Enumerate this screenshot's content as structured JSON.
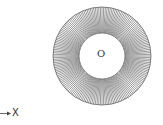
{
  "diagram": {
    "type": "annulus-with-radial-lines",
    "center_label": "O",
    "axis_label": "X",
    "geometry": {
      "center": [
        102,
        56
      ],
      "outer_radius": 49,
      "inner_radius": 23,
      "radial_line_count": 180
    },
    "colors": {
      "line": "#555555",
      "background": "#ffffff"
    }
  }
}
